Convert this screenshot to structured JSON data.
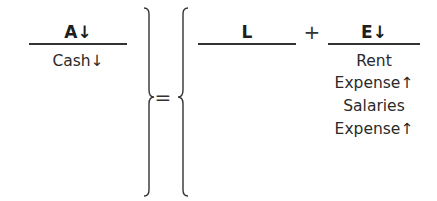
{
  "equation": {
    "assets": {
      "header": "A↓",
      "items": [
        "Cash↓"
      ]
    },
    "equals": "=",
    "liabilities": {
      "header": "L",
      "items": []
    },
    "plus": "+",
    "equity": {
      "header": "E↓",
      "items": [
        "Rent",
        "Expense↑",
        "Salaries",
        "Expense↑"
      ]
    }
  }
}
